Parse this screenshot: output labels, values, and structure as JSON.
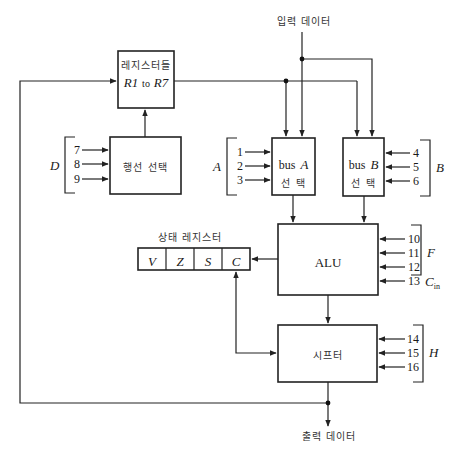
{
  "diagram": {
    "type": "processor-unit-block-diagram",
    "input_data_label": "입력 데이터",
    "output_data_label": "출력 데이터",
    "registers": {
      "title": "레지스터들",
      "range_label_r1": "R1",
      "range_label_to": "to",
      "range_label_r7": "R7"
    },
    "line_select": {
      "label": "행선 선택"
    },
    "bus_a": {
      "label_bus": "bus",
      "label_letter": "A",
      "label_select": "선  택"
    },
    "bus_b": {
      "label_bus": "bus",
      "label_letter": "B",
      "label_select": "선  택"
    },
    "alu": {
      "label": "ALU"
    },
    "shifter": {
      "label": "시프터"
    },
    "status_register": {
      "title": "상태 레지스터",
      "flags": [
        "V",
        "Z",
        "S",
        "C"
      ]
    },
    "control_groups": {
      "D": {
        "name": "D",
        "lines": [
          "7",
          "8",
          "9"
        ]
      },
      "A": {
        "name": "A",
        "lines": [
          "1",
          "2",
          "3"
        ]
      },
      "B": {
        "name": "B",
        "lines": [
          "4",
          "5",
          "6"
        ]
      },
      "F": {
        "name": "F",
        "lines": [
          "10",
          "11",
          "12"
        ]
      },
      "Cin": {
        "line": "13",
        "name": "C",
        "subscript": "in"
      },
      "H": {
        "name": "H",
        "lines": [
          "14",
          "15",
          "16"
        ]
      }
    }
  }
}
